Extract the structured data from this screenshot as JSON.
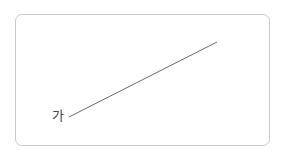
{
  "diagram": {
    "label": "가",
    "line": {
      "x1": 69,
      "y1": 117,
      "x2": 217,
      "y2": 42,
      "color": "#6a6a6a"
    },
    "frame_border_color": "#c9c9c9"
  }
}
